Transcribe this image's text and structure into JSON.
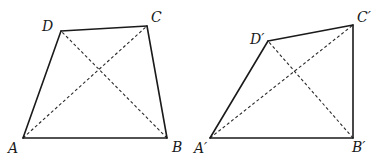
{
  "figures": [
    {
      "name": "quadrilateral-ABCD",
      "vertices": {
        "A": {
          "label": "A",
          "x": 23,
          "y": 138,
          "lx": 8,
          "ly": 153
        },
        "B": {
          "label": "B",
          "x": 167,
          "y": 138,
          "lx": 172,
          "ly": 152
        },
        "C": {
          "label": "C",
          "x": 147,
          "y": 26,
          "lx": 151,
          "ly": 22
        },
        "D": {
          "label": "D",
          "x": 61,
          "y": 31,
          "lx": 42,
          "ly": 31
        }
      },
      "sides": [
        "AB",
        "BC",
        "CD",
        "DA"
      ],
      "diagonals": [
        "AC",
        "BD"
      ]
    },
    {
      "name": "quadrilateral-A'B'C'D'",
      "vertices": {
        "A": {
          "label": "A′",
          "x": 210,
          "y": 138,
          "lx": 194,
          "ly": 153
        },
        "B": {
          "label": "B′",
          "x": 353,
          "y": 138,
          "lx": 352,
          "ly": 152
        },
        "C": {
          "label": "C′",
          "x": 353,
          "y": 25,
          "lx": 357,
          "ly": 22
        },
        "D": {
          "label": "D′",
          "x": 268,
          "y": 41,
          "lx": 250,
          "ly": 44
        }
      },
      "sides": [
        "A'B'",
        "B'C'",
        "C'D'",
        "D'A'"
      ],
      "diagonals": [
        "A'C'",
        "B'D'"
      ]
    }
  ]
}
